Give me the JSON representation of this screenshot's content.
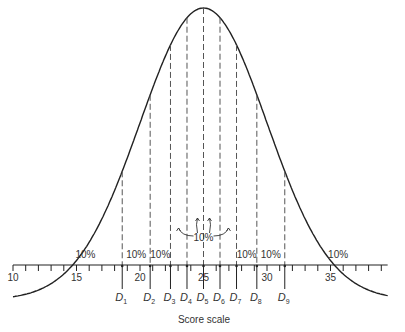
{
  "figure": {
    "xlabel": "Score scale",
    "axis": {
      "min": 10,
      "max": 39.5,
      "tick_step": 1,
      "major_labels": [
        "10",
        "15",
        "20",
        "25",
        "30",
        "35"
      ]
    },
    "distribution": {
      "type": "normal",
      "mean": 25,
      "sd": 5
    },
    "deciles": [
      {
        "label": "D",
        "sub": "1",
        "score": 18.6
      },
      {
        "label": "D",
        "sub": "2",
        "score": 20.8
      },
      {
        "label": "D",
        "sub": "3",
        "score": 22.4
      },
      {
        "label": "D",
        "sub": "4",
        "score": 23.7
      },
      {
        "label": "D",
        "sub": "5",
        "score": 25.0
      },
      {
        "label": "D",
        "sub": "6",
        "score": 26.3
      },
      {
        "label": "D",
        "sub": "7",
        "score": 27.6
      },
      {
        "label": "D",
        "sub": "8",
        "score": 29.2
      },
      {
        "label": "D",
        "sub": "9",
        "score": 31.4
      }
    ],
    "percent_labels": [
      "10%",
      "10%",
      "10%",
      "10%",
      "10%",
      "10%",
      "10%"
    ],
    "center_label": "10%"
  }
}
